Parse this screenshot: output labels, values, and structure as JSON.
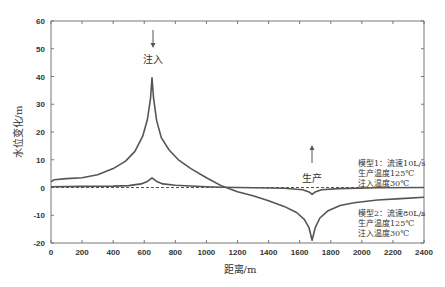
{
  "chart_data": {
    "type": "line",
    "title": "",
    "xlabel": "距离/m",
    "ylabel": "水位变化/m",
    "xlim": [
      0,
      2400
    ],
    "ylim": [
      -20,
      60
    ],
    "x_ticks": [
      0,
      200,
      400,
      600,
      800,
      1000,
      1200,
      1400,
      1600,
      1800,
      2000,
      2200,
      2400
    ],
    "y_ticks": [
      -20,
      -10,
      0,
      10,
      20,
      30,
      40,
      50,
      60
    ],
    "grid": false,
    "series": [
      {
        "name": "模型1：流速10L/s，生产温度125℃，注入温度30℃",
        "x": [
          0,
          200,
          400,
          500,
          580,
          620,
          650,
          680,
          720,
          800,
          1000,
          1100,
          1300,
          1500,
          1620,
          1660,
          1680,
          1700,
          1740,
          1850,
          2100,
          2400
        ],
        "values": [
          0.3,
          0.4,
          0.5,
          0.7,
          1.3,
          2.2,
          3.5,
          2.2,
          1.3,
          0.8,
          0.3,
          0.1,
          -0.1,
          -0.3,
          -0.8,
          -1.6,
          -2.5,
          -1.6,
          -0.8,
          -0.4,
          -0.1,
          0.0
        ]
      },
      {
        "name": "模型2：流速80L/s，生产温度125℃，注入温度30℃",
        "x": [
          0,
          20,
          100,
          200,
          300,
          400,
          480,
          540,
          590,
          620,
          640,
          650,
          660,
          680,
          710,
          760,
          820,
          900,
          1000,
          1100,
          1200,
          1300,
          1400,
          1500,
          1580,
          1630,
          1660,
          1680,
          1700,
          1730,
          1780,
          1860,
          1950,
          2100,
          2250,
          2400
        ],
        "values": [
          2.0,
          2.8,
          3.2,
          3.5,
          4.6,
          6.8,
          9.5,
          13.0,
          18.5,
          24.5,
          32.0,
          39.5,
          32.0,
          24.0,
          18.0,
          13.5,
          10.0,
          6.8,
          3.5,
          0.5,
          -1.5,
          -3.0,
          -4.8,
          -6.8,
          -9.0,
          -11.5,
          -14.5,
          -19.0,
          -14.5,
          -11.0,
          -8.5,
          -6.5,
          -5.5,
          -4.5,
          -4.0,
          -3.5
        ]
      },
      {
        "name": "zero-reference",
        "style": "dashed",
        "x": [
          0,
          2400
        ],
        "values": [
          0,
          0
        ]
      }
    ],
    "annotations": [
      {
        "text": "注入",
        "x": 650,
        "arrow": "down"
      },
      {
        "text": "生产",
        "x": 1680,
        "arrow": "up"
      }
    ],
    "legend_position": "right, inline text"
  },
  "labels": {
    "ylabel": "水位变化/m",
    "xlabel": "距离/m",
    "inject": "注入",
    "produce": "生产",
    "model1": [
      "模型1：流速10L/s",
      "生产温度125℃",
      "注入温度30℃"
    ],
    "model2": [
      "模型2：流速80L/s",
      "生产温度125℃",
      "注入温度30℃"
    ]
  },
  "colors": {
    "line": "#555555",
    "axis": "#777777",
    "text": "#333333"
  }
}
